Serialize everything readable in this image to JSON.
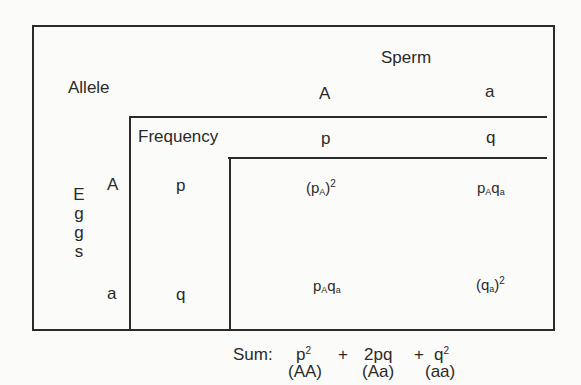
{
  "diagram": {
    "labels": {
      "allele": "Allele",
      "frequency": "Frequency",
      "sperm": "Sperm",
      "eggs": [
        "E",
        "g",
        "g",
        "s"
      ]
    },
    "sperm_alleles": [
      {
        "allele": "A",
        "frequency": "p"
      },
      {
        "allele": "a",
        "frequency": "q"
      }
    ],
    "egg_alleles": [
      {
        "allele": "A",
        "frequency": "p"
      },
      {
        "allele": "a",
        "frequency": "q"
      }
    ],
    "cells": {
      "AA": {
        "base": "(p",
        "sub": "A",
        "close": ")",
        "sup": "2"
      },
      "Aa_top": {
        "p": "p",
        "p_sub": "A",
        "q": "q",
        "q_sub": "a"
      },
      "Aa_bottom": {
        "p": "p",
        "p_sub": "A",
        "q": "q",
        "q_sub": "a"
      },
      "aa": {
        "base": "(q",
        "sub": "a",
        "close": ")",
        "sup": "2"
      }
    },
    "sum": {
      "label": "Sum:",
      "terms": [
        {
          "expr": "p",
          "sup": "2",
          "genotype": "(AA)"
        },
        {
          "expr": "2pq",
          "sup": "",
          "genotype": "(Aa)"
        },
        {
          "expr": "q",
          "sup": "2",
          "genotype": "(aa)"
        }
      ],
      "plus": "+"
    }
  }
}
